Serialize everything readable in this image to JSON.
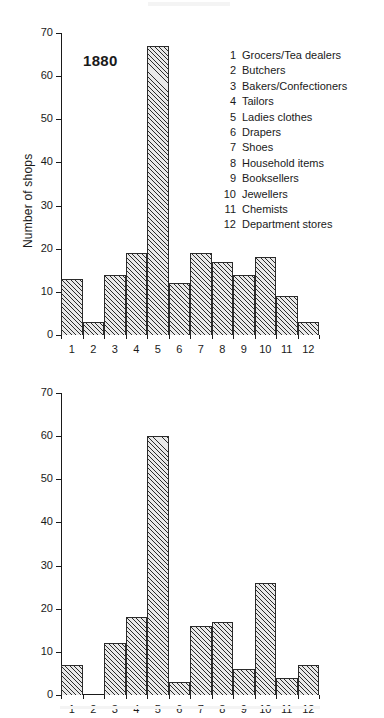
{
  "figure": {
    "y_axis_title": "Number of shops"
  },
  "legend": {
    "items": [
      {
        "key": "1",
        "label": "Grocers/Tea dealers"
      },
      {
        "key": "2",
        "label": "Butchers"
      },
      {
        "key": "3",
        "label": "Bakers/Confectioners"
      },
      {
        "key": "4",
        "label": "Tailors"
      },
      {
        "key": "5",
        "label": "Ladies clothes"
      },
      {
        "key": "6",
        "label": "Drapers"
      },
      {
        "key": "7",
        "label": "Shoes"
      },
      {
        "key": "8",
        "label": "Household items"
      },
      {
        "key": "9",
        "label": "Booksellers"
      },
      {
        "key": "10",
        "label": "Jewellers"
      },
      {
        "key": "11",
        "label": "Chemists"
      },
      {
        "key": "12",
        "label": "Department stores"
      }
    ]
  },
  "panels": [
    {
      "id": "1880",
      "year_label": "1880",
      "y_axis_title": "Number of shops"
    },
    {
      "id": "1911",
      "year_label": "1911",
      "y_axis_title": "Number of shops"
    }
  ],
  "colors": {
    "ink": "#1a1a1a",
    "bar_outline": "#2b2b2b",
    "bar_fill": "#e9e9e9",
    "page": "#ffffff"
  },
  "chart_data": [
    {
      "type": "bar",
      "title": "1880",
      "xlabel": "",
      "ylabel": "Number of shops",
      "ylim": [
        0,
        70
      ],
      "yticks": [
        0,
        10,
        20,
        30,
        40,
        50,
        60,
        70
      ],
      "ytick_labels": [
        "0",
        "10",
        "20",
        "30",
        "40",
        "50",
        "60",
        "70"
      ],
      "grid": false,
      "legend_position": "inside-top-right",
      "categories": [
        "1",
        "2",
        "3",
        "4",
        "5",
        "6",
        "7",
        "8",
        "9",
        "10",
        "11",
        "12"
      ],
      "category_names": [
        "Grocers/Tea dealers",
        "Butchers",
        "Bakers/Confectioners",
        "Tailors",
        "Ladies clothes",
        "Drapers",
        "Shoes",
        "Household items",
        "Booksellers",
        "Jewellers",
        "Chemists",
        "Department stores"
      ],
      "values": [
        13,
        3,
        14,
        19,
        67,
        12,
        19,
        17,
        14,
        18,
        9,
        3
      ]
    },
    {
      "type": "bar",
      "title": "1911",
      "xlabel": "",
      "ylabel": "Number of shops",
      "ylim": [
        0,
        70
      ],
      "yticks": [
        0,
        10,
        20,
        30,
        40,
        50,
        60,
        70
      ],
      "ytick_labels": [
        "0",
        "10",
        "20",
        "30",
        "40",
        "50",
        "60",
        "70"
      ],
      "grid": false,
      "legend_position": "none",
      "categories": [
        "1",
        "2",
        "3",
        "4",
        "5",
        "6",
        "7",
        "8",
        "9",
        "10",
        "11",
        "12"
      ],
      "category_names": [
        "Grocers/Tea dealers",
        "Butchers",
        "Bakers/Confectioners",
        "Tailors",
        "Ladies clothes",
        "Drapers",
        "Shoes",
        "Household items",
        "Booksellers",
        "Jewellers",
        "Chemists",
        "Department stores"
      ],
      "values": [
        7,
        0,
        12,
        18,
        60,
        3,
        16,
        17,
        6,
        26,
        4,
        7
      ]
    }
  ]
}
